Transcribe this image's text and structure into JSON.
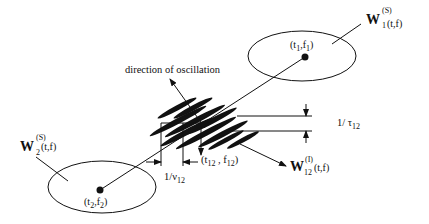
{
  "diagram": {
    "title": "",
    "colors": {
      "ink": "#111111",
      "background": "#ffffff"
    },
    "auto_terms": {
      "term1": {
        "symbol": "W",
        "superscript": "(S)",
        "subscript": "1",
        "args": "(t,f)",
        "center_label": {
          "t": "t",
          "t_sub": "1",
          "f": "f",
          "f_sub": "1"
        }
      },
      "term2": {
        "symbol": "W",
        "superscript": "(S)",
        "subscript": "2",
        "args": "(t,f)",
        "center_label": {
          "t": "t",
          "t_sub": "2",
          "f": "f",
          "f_sub": "2"
        }
      }
    },
    "cross_term": {
      "symbol": "W",
      "superscript": "(I)",
      "subscript": "12",
      "args": "(t,f)",
      "center_label": {
        "t": "t",
        "t_sub": "12",
        "f": "f",
        "f_sub": "12"
      },
      "direction_label": "direction of oscillation",
      "period_time": {
        "text": "1/",
        "symbol": "ν",
        "sub": "12"
      },
      "period_freq": {
        "text": "1/",
        "symbol": "τ",
        "sub": "12"
      }
    },
    "glyphs": {
      "open": "(",
      "close": ")",
      "comma": ",",
      "space_comma": " , "
    }
  }
}
